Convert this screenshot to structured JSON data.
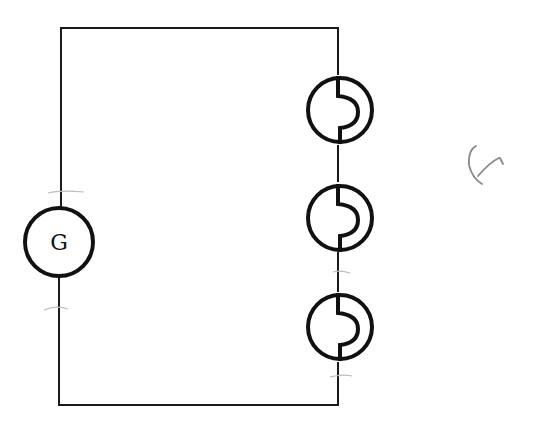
{
  "diagram": {
    "type": "circuit",
    "generator": {
      "label": "G",
      "symbol": "generator-icon"
    },
    "lamps": [
      {
        "id": "lamp-1",
        "symbol": "lamp-icon"
      },
      {
        "id": "lamp-2",
        "symbol": "lamp-icon"
      },
      {
        "id": "lamp-3",
        "symbol": "lamp-icon"
      }
    ],
    "annotation": {
      "text": "handwritten mark"
    },
    "colors": {
      "wire": "#1a1a1a",
      "background": "#ffffff",
      "scribble": "#8a8a8a"
    }
  }
}
